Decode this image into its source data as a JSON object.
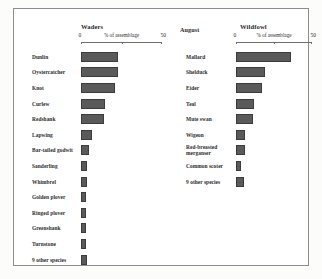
{
  "figure": {
    "period_label": "August",
    "axis_caption": "% of assemblage",
    "axis_min_label": "0",
    "axis_max_label": "50",
    "bar_color": "#5a5a5a",
    "frame_color": "#8d8d8d"
  },
  "panels": {
    "waders": {
      "title": "Waders"
    },
    "wildfowl": {
      "title": "Wildfowl"
    }
  },
  "chart_data": [
    {
      "type": "bar",
      "orientation": "horizontal",
      "title": "Waders",
      "subtitle": "August",
      "xlabel": "% of assemblage",
      "ylabel": "",
      "xlim": [
        0,
        50
      ],
      "xticks": [
        0,
        25,
        50
      ],
      "xticklabels": [
        "0",
        "",
        "50"
      ],
      "grid": false,
      "legend": "none",
      "categories": [
        "Dunlin",
        "Oystercatcher",
        "Knot",
        "Curlew",
        "Redshank",
        "Lapwing",
        "Bar-tailed godwit",
        "Sanderling",
        "Whimbrel",
        "Golden plover",
        "Ringed plover",
        "Greenshank",
        "Turnstone",
        "9 other species"
      ],
      "values": [
        23,
        23,
        21,
        15,
        14,
        7,
        5,
        4,
        4,
        3,
        3,
        3,
        3,
        4
      ]
    },
    {
      "type": "bar",
      "orientation": "horizontal",
      "title": "Wildfowl",
      "subtitle": "August",
      "xlabel": "% of assemblage",
      "ylabel": "",
      "xlim": [
        0,
        50
      ],
      "xticks": [
        0,
        25,
        50
      ],
      "xticklabels": [
        "0",
        "",
        "50"
      ],
      "grid": false,
      "legend": "none",
      "categories": [
        "Mallard",
        "Shelduck",
        "Eider",
        "Teal",
        "Mute swan",
        "Wigeon",
        "Red-breasted merganser",
        "Common scoter",
        "9 other species"
      ],
      "values": [
        36,
        19,
        17,
        12,
        11,
        6,
        6,
        3,
        5
      ]
    }
  ]
}
